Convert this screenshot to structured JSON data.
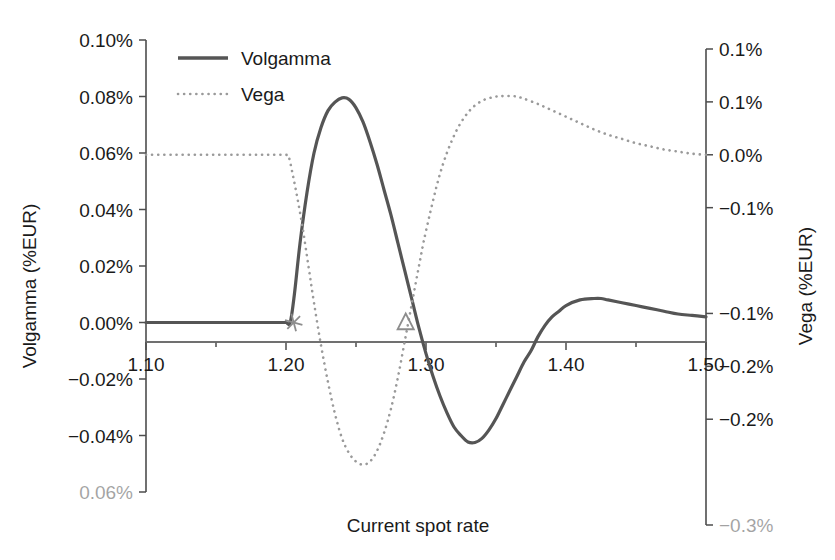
{
  "chart_data": {
    "type": "line",
    "title": "",
    "xlabel": "Current spot rate",
    "ylabel": "Volgamma (%EUR)",
    "y2label": "Vega (%EUR)",
    "xlim": [
      1.1,
      1.5
    ],
    "ylim": [
      -0.0006,
      0.001
    ],
    "y2lim": [
      -0.003,
      0.0015
    ],
    "grid": false,
    "legend_position": "top-left",
    "x_tick_labels": [
      "1.10",
      "1.20",
      "1.30",
      "1.40",
      "1.50"
    ],
    "x_tick_values": [
      1.1,
      1.2,
      1.3,
      1.4,
      1.5
    ],
    "x_minor_tick_values": [
      1.15,
      1.25,
      1.35,
      1.45
    ],
    "y_tick_labels": [
      "0.10%",
      "0.08%",
      "0.06%",
      "0.04%",
      "0.02%",
      "0.00%",
      "-0.02%",
      "-0.04%",
      "-0.06%"
    ],
    "y_tick_values": [
      0.001,
      0.0008,
      0.0006,
      0.0004,
      0.0002,
      0.0,
      -0.0002,
      -0.0004,
      -0.0006
    ],
    "y_tick_faded_index": 8,
    "y2_tick_labels": [
      "0.1%",
      "0.1%",
      "0.0%",
      "-0.1%",
      "-0.1%",
      "-0.2%",
      "-0.2%",
      "-0.3%"
    ],
    "y2_tick_values": [
      0.0015,
      0.001,
      0.0005,
      0.0,
      -0.0005,
      -0.001,
      -0.0015,
      -0.002,
      -0.0025,
      -0.003
    ],
    "y2_tick_display_values": [
      0.0015,
      0.001,
      0.0005,
      0.0,
      -0.001,
      -0.0015,
      -0.002,
      -0.003
    ],
    "y2_tick_faded_index": 7,
    "series": [
      {
        "name": "Volgamma",
        "axis": "left",
        "style": "solid",
        "color": "#555555",
        "x": [
          1.1,
          1.12,
          1.14,
          1.16,
          1.18,
          1.195,
          1.2,
          1.203,
          1.206,
          1.21,
          1.215,
          1.22,
          1.225,
          1.23,
          1.235,
          1.24,
          1.245,
          1.25,
          1.255,
          1.26,
          1.265,
          1.27,
          1.275,
          1.28,
          1.285,
          1.29,
          1.295,
          1.3,
          1.305,
          1.31,
          1.315,
          1.32,
          1.325,
          1.33,
          1.335,
          1.34,
          1.345,
          1.35,
          1.355,
          1.36,
          1.365,
          1.37,
          1.375,
          1.38,
          1.385,
          1.39,
          1.395,
          1.4,
          1.41,
          1.42,
          1.425,
          1.43,
          1.44,
          1.45,
          1.46,
          1.47,
          1.48,
          1.49,
          1.5
        ],
        "y": [
          0.0,
          0.0,
          0.0,
          0.0,
          0.0,
          0.0,
          0.0,
          0.0,
          0.0001,
          0.00028,
          0.00046,
          0.0006,
          0.00069,
          0.00075,
          0.00078,
          0.000795,
          0.00079,
          0.00076,
          0.00071,
          0.00064,
          0.00056,
          0.00047,
          0.00038,
          0.00028,
          0.00018,
          8e-05,
          -2e-05,
          -0.00011,
          -0.00019,
          -0.00026,
          -0.00032,
          -0.00037,
          -0.0004,
          -0.000423,
          -0.000425,
          -0.00041,
          -0.00038,
          -0.00034,
          -0.00029,
          -0.00024,
          -0.00019,
          -0.00014,
          -0.0001,
          -5e-05,
          -1e-05,
          2e-05,
          4e-05,
          6e-05,
          8e-05,
          8.5e-05,
          8.5e-05,
          8e-05,
          7e-05,
          6e-05,
          5e-05,
          4e-05,
          3e-05,
          2.5e-05,
          2e-05
        ]
      },
      {
        "name": "Vega",
        "axis": "right",
        "style": "dotted",
        "color": "#9a9a9a",
        "x": [
          1.1,
          1.12,
          1.14,
          1.16,
          1.18,
          1.195,
          1.2,
          1.202,
          1.205,
          1.208,
          1.212,
          1.216,
          1.22,
          1.225,
          1.23,
          1.235,
          1.24,
          1.245,
          1.25,
          1.255,
          1.26,
          1.265,
          1.27,
          1.275,
          1.28,
          1.285,
          1.29,
          1.295,
          1.3,
          1.31,
          1.32,
          1.33,
          1.34,
          1.35,
          1.355,
          1.36,
          1.365,
          1.37,
          1.38,
          1.39,
          1.4,
          1.41,
          1.42,
          1.43,
          1.44,
          1.45,
          1.46,
          1.47,
          1.48,
          1.49,
          1.5
        ],
        "y": [
          0.0005,
          0.0005,
          0.0005,
          0.0005,
          0.0005,
          0.0005,
          0.0005,
          0.00048,
          0.0003,
          0.0001,
          -0.0002,
          -0.00055,
          -0.0009,
          -0.0013,
          -0.00165,
          -0.00195,
          -0.00218,
          -0.00232,
          -0.0024,
          -0.00243,
          -0.0024,
          -0.0023,
          -0.00213,
          -0.0019,
          -0.0016,
          -0.00125,
          -0.0009,
          -0.00055,
          -0.00022,
          0.00032,
          0.00068,
          0.0009,
          0.00101,
          0.00105,
          0.001055,
          0.001055,
          0.00105,
          0.00103,
          0.00098,
          0.00092,
          0.00086,
          0.0008,
          0.00074,
          0.00069,
          0.00065,
          0.00061,
          0.00058,
          0.00055,
          0.00053,
          0.00051,
          0.0005
        ]
      }
    ],
    "markers": [
      {
        "name": "star-marker",
        "shape": "asterisk",
        "x": 1.2055,
        "y": 0.0,
        "axis": "left"
      },
      {
        "name": "triangle-marker",
        "shape": "triangle",
        "x": 1.2855,
        "y": 0.0,
        "axis": "left"
      }
    ]
  },
  "legend": {
    "entries": [
      {
        "label": "Volgamma",
        "style": "solid"
      },
      {
        "label": "Vega",
        "style": "dotted"
      }
    ]
  }
}
